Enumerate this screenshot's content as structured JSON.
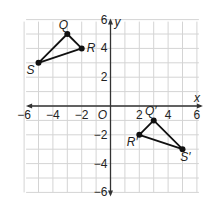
{
  "axes": {
    "x_label": "x",
    "y_label": "y",
    "origin_label": "O",
    "x_ticks": [
      {
        "value": -6,
        "label": "−6"
      },
      {
        "value": -4,
        "label": "−4"
      },
      {
        "value": -2,
        "label": "−2"
      },
      {
        "value": 2,
        "label": "2"
      },
      {
        "value": 4,
        "label": "4"
      },
      {
        "value": 6,
        "label": "6"
      }
    ],
    "y_ticks": [
      {
        "value": 6,
        "label": "6"
      },
      {
        "value": 4,
        "label": "4"
      },
      {
        "value": 2,
        "label": "2"
      },
      {
        "value": -2,
        "label": "−2"
      },
      {
        "value": -4,
        "label": "−4"
      },
      {
        "value": -6,
        "label": "−6"
      }
    ],
    "range": [
      -6,
      6
    ]
  },
  "triangles": [
    {
      "name": "QRS",
      "points": [
        {
          "label": "Q",
          "x": -3,
          "y": 5
        },
        {
          "label": "R",
          "x": -2,
          "y": 4
        },
        {
          "label": "S",
          "x": -5,
          "y": 3
        }
      ]
    },
    {
      "name": "Q'R'S'",
      "points": [
        {
          "label": "Q′",
          "x": 3,
          "y": -1
        },
        {
          "label": "R′",
          "x": 2,
          "y": -2
        },
        {
          "label": "S′",
          "x": 5,
          "y": -3
        }
      ]
    }
  ],
  "colors": {
    "grid": "#d4d4d4",
    "axis": "#333333",
    "shape": "#111111"
  }
}
